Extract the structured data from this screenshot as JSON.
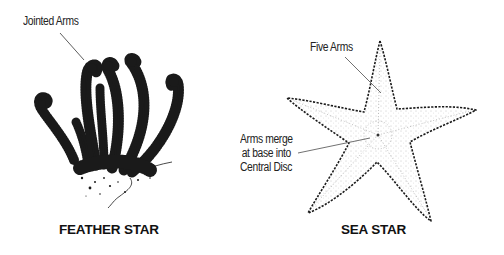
{
  "diagram": {
    "left_panel": {
      "title": "FEATHER STAR",
      "callout": "Jointed Arms"
    },
    "right_panel": {
      "title": "SEA STAR",
      "callout_top": "Five Arms",
      "callout_side_lines": [
        "Arms merge",
        "at base into",
        "Central Disc"
      ]
    }
  },
  "colors": {
    "ink": "#1a1a1a",
    "background": "#ffffff",
    "stipple": "#8a8a8a"
  }
}
